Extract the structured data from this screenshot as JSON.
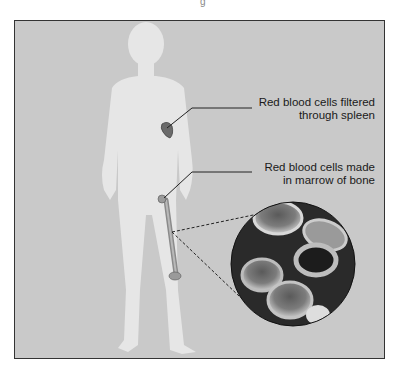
{
  "diagram": {
    "title_fragment": "g",
    "labels": {
      "spleen": {
        "line1": "Red blood cells filtered",
        "line2": "through spleen"
      },
      "marrow": {
        "line1": "Red blood cells made",
        "line2": "in marrow of bone"
      }
    },
    "colors": {
      "background": "#c9c9c9",
      "body": "#e6e6e6",
      "organ": "#6a6a6a",
      "frame": "#333333",
      "text": "#1a1a1a"
    },
    "elements": [
      "human-silhouette",
      "spleen",
      "femur-bone",
      "magnified-red-blood-cells"
    ]
  }
}
